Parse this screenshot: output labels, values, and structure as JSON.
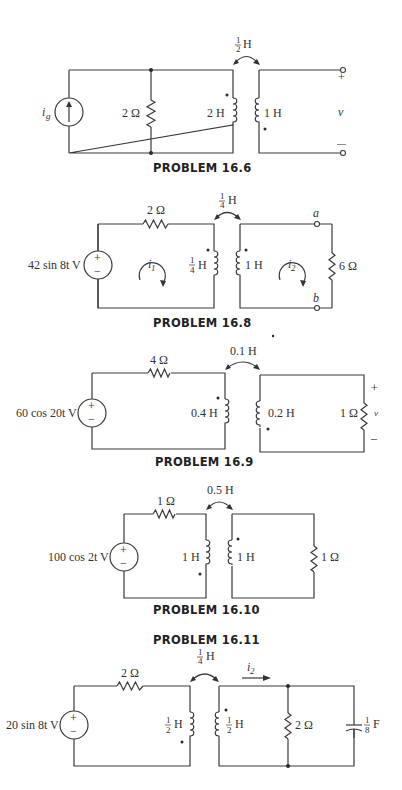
{
  "problems": [
    {
      "title": "PROBLEM 16.6",
      "source_label": "i",
      "source_sub": "g",
      "resistor": "2 Ω",
      "mutual_num": "1",
      "mutual_den": "2",
      "mutual_unit": "H",
      "l1": "2 H",
      "l2": "1 H",
      "v_label": "v",
      "plus": "+",
      "minus": "—"
    },
    {
      "title": "PROBLEM 16.8",
      "source": "42 sin 8t V",
      "resistor1": "2 Ω",
      "mutual_num": "1",
      "mutual_den": "4",
      "mutual_unit": "H",
      "l1_num": "1",
      "l1_den": "4",
      "l1_unit": "H",
      "l2": "1 H",
      "i1": "i",
      "i1_sub": "1",
      "i2": "i",
      "i2_sub": "2",
      "node_a": "a",
      "node_b": "b",
      "resistor2": "6 Ω"
    },
    {
      "title": "PROBLEM 16.9",
      "source": "60 cos 20t V",
      "resistor1": "4 Ω",
      "mutual": "0.1 H",
      "l1": "0.4 H",
      "l2": "0.2 H",
      "resistor2": "1 Ω",
      "v_label": "v",
      "plus": "+",
      "minus": "–"
    },
    {
      "title": "PROBLEM 16.10",
      "source": "100 cos 2t V",
      "resistor1": "1 Ω",
      "mutual": "0.5 H",
      "l1": "1 H",
      "l2": "1 H",
      "resistor2": "1 Ω"
    },
    {
      "title": "PROBLEM 16.11",
      "source": "20 sin 8t V",
      "resistor1": "2 Ω",
      "mutual_num": "1",
      "mutual_den": "4",
      "mutual_unit": "H",
      "l1_num": "1",
      "l1_den": "2",
      "l1_unit": "H",
      "l2_num": "1",
      "l2_den": "2",
      "l2_unit": "H",
      "i2": "i",
      "i2_sub": "2",
      "resistor2": "2 Ω",
      "cap_num": "1",
      "cap_den": "8",
      "cap_unit": "F"
    }
  ]
}
